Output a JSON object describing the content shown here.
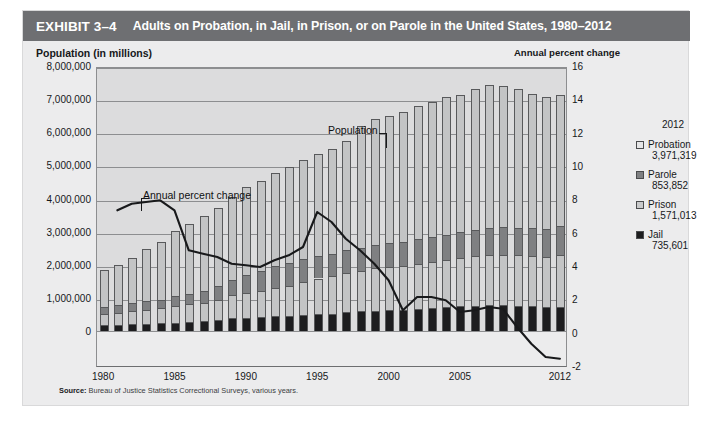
{
  "exhibit": {
    "number": "EXHIBIT 3–4",
    "title": "Adults on Probation, in Jail, in Prison, or on Parole in the United States, 1980–2012"
  },
  "axis_title_left": "Population (in millions)",
  "axis_title_right": "Annual percent change",
  "annotations": {
    "population": "Population",
    "annual_percent_change": "Annual percent change"
  },
  "legend": {
    "year": "2012",
    "items": [
      {
        "name": "Probation",
        "value": "3,971,319",
        "swatch": "probation-swatch",
        "color": "#e6e6e7"
      },
      {
        "name": "Parole",
        "value": "853,852",
        "swatch": "parole-swatch",
        "color": "#7f8082"
      },
      {
        "name": "Prison",
        "value": "1,571,013",
        "swatch": "prison-swatch",
        "color": "#c9cacb"
      },
      {
        "name": "Jail",
        "value": "735,601",
        "swatch": "jail-swatch",
        "color": "#1d1d1f"
      }
    ]
  },
  "source": {
    "label": "Source:",
    "text": "Bureau of Justice Statistics Correctional Surveys, various years."
  },
  "chart_data": {
    "type": "bar",
    "title": "Adults on Probation, in Jail, in Prison, or on Parole in the United States, 1980–2012",
    "xlabel": "",
    "ylabel": "Population (in millions)",
    "y2label": "Annual percent change",
    "grid": true,
    "legend_position": "right",
    "ylim": [
      0,
      8000000
    ],
    "ytick_labels": [
      "8,000,000",
      "7,000,000",
      "6,000,000",
      "5,000,000",
      "4,000,000",
      "3,000,000",
      "2,000,000",
      "1,000,000",
      "0"
    ],
    "yticks": [
      8000000,
      7000000,
      6000000,
      5000000,
      4000000,
      3000000,
      2000000,
      1000000,
      0
    ],
    "y2lim": [
      -2,
      16
    ],
    "y2ticks": [
      16,
      14,
      12,
      10,
      8,
      6,
      4,
      2,
      0,
      -2
    ],
    "y2tick_labels": [
      "16",
      "14",
      "12",
      "10",
      "8",
      "6",
      "4",
      "2",
      "0",
      "-2"
    ],
    "xtick_labels": [
      "1980",
      "1985",
      "1990",
      "1995",
      "2000",
      "2005",
      "2012"
    ],
    "categories": [
      1980,
      1981,
      1982,
      1983,
      1984,
      1985,
      1986,
      1987,
      1988,
      1989,
      1990,
      1991,
      1992,
      1993,
      1994,
      1995,
      1996,
      1997,
      1998,
      1999,
      2000,
      2001,
      2002,
      2003,
      2004,
      2005,
      2006,
      2007,
      2008,
      2009,
      2010,
      2011,
      2012
    ],
    "stacked": true,
    "stack_order_bottom_to_top": [
      "Jail",
      "Prison",
      "Parole",
      "Probation"
    ],
    "series": [
      {
        "name": "Jail",
        "color": "#1d1d1f",
        "values": [
          182288,
          195085,
          209582,
          223551,
          234500,
          256615,
          274444,
          295873,
          341893,
          395553,
          405320,
          426479,
          444584,
          459804,
          486474,
          507044,
          518492,
          567079,
          592462,
          605943,
          621149,
          631240,
          665475,
          691301,
          713990,
          747529,
          765819,
          780174,
          785533,
          767434,
          748728,
          735565,
          735601
        ]
      },
      {
        "name": "Prison",
        "color": "#c3c4c5",
        "values": [
          319598,
          360029,
          402914,
          423898,
          448264,
          487593,
          526436,
          562814,
          607766,
          683367,
          743382,
          792535,
          850566,
          909381,
          990147,
          1078542,
          1127528,
          1176564,
          1224469,
          1287172,
          1316333,
          1330007,
          1367547,
          1390279,
          1421345,
          1448344,
          1492973,
          1517867,
          1518559,
          1524513,
          1518104,
          1504150,
          1571013
        ]
      },
      {
        "name": "Parole",
        "color": "#7f8082",
        "values": [
          220438,
          225539,
          224604,
          246440,
          266992,
          300203,
          325638,
          355505,
          407977,
          456803,
          531407,
          590442,
          658601,
          676100,
          690371,
          679421,
          679733,
          694787,
          696385,
          714457,
          723898,
          732333,
          750934,
          769925,
          771852,
          780616,
          798202,
          821177,
          828169,
          824365,
          840676,
          853852,
          853852
        ]
      },
      {
        "name": "Probation",
        "color": "#c3c4c5",
        "values": [
          1118097,
          1225934,
          1357264,
          1582947,
          1740948,
          1968712,
          2114621,
          2247158,
          2356483,
          2522125,
          2670234,
          2728472,
          2811611,
          2903061,
          2981022,
          3077861,
          3164996,
          3296513,
          3670441,
          3779922,
          3826209,
          3931731,
          3995165,
          4073987,
          4151125,
          4162536,
          4236800,
          4293163,
          4270917,
          4203967,
          4055514,
          3973800,
          3971319
        ]
      }
    ],
    "line_series": {
      "name": "Annual percent change",
      "axis": "y2",
      "color": "#18191b",
      "x": [
        1981,
        1982,
        1983,
        1984,
        1985,
        1986,
        1987,
        1988,
        1989,
        1990,
        1991,
        1992,
        1993,
        1994,
        1995,
        1996,
        1997,
        1998,
        1999,
        2000,
        2001,
        2002,
        2003,
        2004,
        2005,
        2006,
        2007,
        2008,
        2009,
        2010,
        2011,
        2012
      ],
      "values": [
        7.4,
        7.8,
        7.9,
        8.0,
        7.4,
        5.0,
        4.8,
        4.6,
        4.2,
        4.1,
        4.0,
        4.4,
        4.7,
        5.2,
        7.3,
        6.7,
        5.7,
        5.0,
        4.2,
        3.2,
        1.4,
        2.2,
        2.2,
        2.0,
        1.3,
        1.4,
        1.6,
        1.5,
        0.4,
        -0.6,
        -1.4,
        -1.5
      ]
    }
  }
}
